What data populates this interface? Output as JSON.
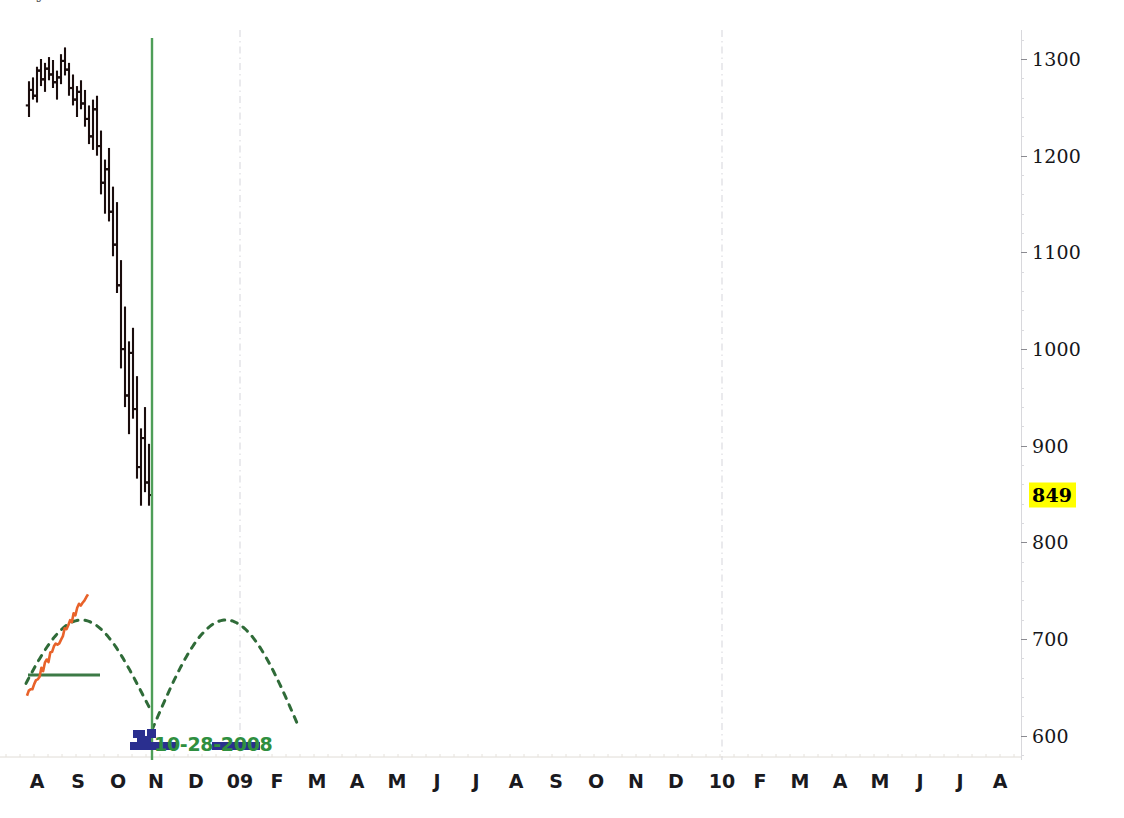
{
  "header": {
    "clipped_text": "Cycle Chart and Forecast"
  },
  "chart_data": {
    "type": "line",
    "title": "",
    "xlabel": "",
    "ylabel": "",
    "grid": false,
    "legend_position": "none",
    "ylim": [
      575,
      1330
    ],
    "y_ticks": [
      600,
      700,
      800,
      900,
      1000,
      1100,
      1200,
      1300
    ],
    "current_value_label": "849",
    "current_value": 849,
    "cursor_date_label": "10-28-2008",
    "x_tick_labels": [
      "A",
      "S",
      "O",
      "N",
      "D",
      "09",
      "F",
      "M",
      "A",
      "M",
      "J",
      "J",
      "A",
      "S",
      "O",
      "N",
      "D",
      "10",
      "F",
      "M",
      "A",
      "M",
      "J",
      "J",
      "A"
    ],
    "x_tick_positions": [
      37,
      78,
      118,
      156,
      196,
      240,
      277,
      317,
      357,
      397,
      437,
      476,
      516,
      556,
      596,
      636,
      676,
      722,
      760,
      800,
      840,
      880,
      920,
      960,
      1000
    ],
    "year_gridlines": [
      240,
      722
    ],
    "cursor_x": 152,
    "series": [
      {
        "name": "Price (OHLC bars)",
        "type": "ohlc",
        "color": "#1a0d0d",
        "bars": [
          {
            "x": 29,
            "open": 1252,
            "high": 1277,
            "low": 1240,
            "close": 1268
          },
          {
            "x": 33,
            "open": 1268,
            "high": 1281,
            "low": 1258,
            "close": 1262
          },
          {
            "x": 37,
            "open": 1262,
            "high": 1292,
            "low": 1255,
            "close": 1288
          },
          {
            "x": 41,
            "open": 1288,
            "high": 1300,
            "low": 1272,
            "close": 1279
          },
          {
            "x": 45,
            "open": 1279,
            "high": 1296,
            "low": 1266,
            "close": 1290
          },
          {
            "x": 49,
            "open": 1290,
            "high": 1302,
            "low": 1278,
            "close": 1284
          },
          {
            "x": 53,
            "open": 1284,
            "high": 1299,
            "low": 1270,
            "close": 1276
          },
          {
            "x": 57,
            "open": 1276,
            "high": 1288,
            "low": 1258,
            "close": 1281
          },
          {
            "x": 61,
            "open": 1281,
            "high": 1305,
            "low": 1274,
            "close": 1298
          },
          {
            "x": 65,
            "open": 1298,
            "high": 1312,
            "low": 1283,
            "close": 1289
          },
          {
            "x": 69,
            "open": 1289,
            "high": 1296,
            "low": 1262,
            "close": 1270
          },
          {
            "x": 73,
            "open": 1270,
            "high": 1284,
            "low": 1252,
            "close": 1258
          },
          {
            "x": 77,
            "open": 1258,
            "high": 1272,
            "low": 1240,
            "close": 1266
          },
          {
            "x": 81,
            "open": 1266,
            "high": 1278,
            "low": 1248,
            "close": 1254
          },
          {
            "x": 85,
            "open": 1254,
            "high": 1268,
            "low": 1230,
            "close": 1238
          },
          {
            "x": 89,
            "open": 1238,
            "high": 1252,
            "low": 1212,
            "close": 1220
          },
          {
            "x": 93,
            "open": 1220,
            "high": 1258,
            "low": 1206,
            "close": 1248
          },
          {
            "x": 97,
            "open": 1248,
            "high": 1262,
            "low": 1200,
            "close": 1210
          },
          {
            "x": 101,
            "open": 1210,
            "high": 1226,
            "low": 1160,
            "close": 1172
          },
          {
            "x": 105,
            "open": 1172,
            "high": 1196,
            "low": 1140,
            "close": 1186
          },
          {
            "x": 109,
            "open": 1186,
            "high": 1208,
            "low": 1132,
            "close": 1142
          },
          {
            "x": 113,
            "open": 1142,
            "high": 1168,
            "low": 1096,
            "close": 1108
          },
          {
            "x": 117,
            "open": 1108,
            "high": 1152,
            "low": 1058,
            "close": 1066
          },
          {
            "x": 121,
            "open": 1066,
            "high": 1092,
            "low": 980,
            "close": 1000
          },
          {
            "x": 125,
            "open": 1000,
            "high": 1044,
            "low": 940,
            "close": 952
          },
          {
            "x": 129,
            "open": 952,
            "high": 1008,
            "low": 912,
            "close": 996
          },
          {
            "x": 133,
            "open": 996,
            "high": 1022,
            "low": 928,
            "close": 938
          },
          {
            "x": 137,
            "open": 938,
            "high": 972,
            "low": 866,
            "close": 878
          },
          {
            "x": 141,
            "open": 878,
            "high": 918,
            "low": 838,
            "close": 908
          },
          {
            "x": 145,
            "open": 908,
            "high": 940,
            "low": 852,
            "close": 862
          },
          {
            "x": 149,
            "open": 862,
            "high": 902,
            "low": 838,
            "close": 849
          }
        ]
      },
      {
        "name": "Cycle oscillator",
        "type": "dashed-sine",
        "color": "#2f6b38",
        "style": "dashed"
      },
      {
        "name": "Momentum trace",
        "type": "jagged-line",
        "color": "#e8622a"
      },
      {
        "name": "Cycle baseline",
        "type": "horizontal-line",
        "color": "#2f6b38",
        "y_px": 675
      }
    ],
    "annotations": [
      {
        "name": "cursor-line",
        "color": "#4e9e58",
        "x": 152,
        "label": "10-28-2008"
      },
      {
        "name": "volume-markers",
        "color": "#2a2f8f"
      }
    ]
  },
  "colors": {
    "bar": "#1a0d0d",
    "cursor_green": "#4e9e58",
    "cycle_green": "#2f6b38",
    "orange": "#e8622a",
    "navy": "#2a2f8f",
    "highlight_yellow": "#ffff00",
    "gridline_gray": "#e2e2e6",
    "axis_gray": "#d8d8dc"
  }
}
